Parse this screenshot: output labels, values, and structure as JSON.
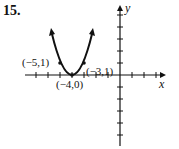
{
  "problem_number": "15.",
  "axes": {
    "x_label": "x",
    "y_label": "y"
  },
  "points": [
    {
      "label": "(−5,1)",
      "x": -5,
      "y": 1
    },
    {
      "label": "(−4,0)",
      "x": -4,
      "y": 0
    },
    {
      "label": "(−3,1)",
      "x": -3,
      "y": 1
    }
  ],
  "curve": {
    "type": "parabola",
    "vertex": [
      -4,
      0
    ],
    "opens": "up"
  }
}
